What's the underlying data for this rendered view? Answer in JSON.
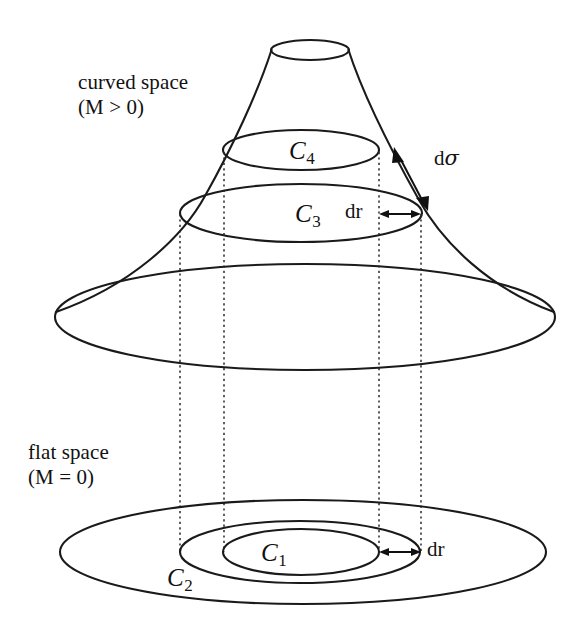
{
  "figure": {
    "background_color": "#ffffff",
    "ink_color": "#111111",
    "width": 571,
    "height": 631
  },
  "labels": {
    "curved_space": {
      "line1": "curved space",
      "line2": "(M > 0)"
    },
    "flat_space": {
      "line1": "flat space",
      "line2": "(M = 0)"
    },
    "circles": {
      "c1": {
        "base": "C",
        "sub": "1"
      },
      "c2": {
        "base": "C",
        "sub": "2"
      },
      "c3": {
        "base": "C",
        "sub": "3"
      },
      "c4": {
        "base": "C",
        "sub": "4"
      }
    },
    "measures": {
      "dr_curved": "dr",
      "dr_flat": "dr",
      "dsigma_prefix": "d",
      "dsigma_symbol": "σ"
    }
  },
  "geometry": {
    "curved_surface": {
      "throat_ellipse": {
        "cx": 310,
        "cy": 50,
        "rx": 39,
        "ry": 10
      },
      "c4_ellipse": {
        "cx": 301,
        "cy": 150,
        "rx": 78,
        "ry": 20
      },
      "c3_ellipse": {
        "cx": 301,
        "cy": 213,
        "rx": 121,
        "ry": 29
      },
      "base_ellipse": {
        "cx": 305,
        "cy": 317,
        "rx": 250,
        "ry": 53
      }
    },
    "flat_surface": {
      "outer_ellipse": {
        "cx": 303,
        "cy": 552,
        "rx": 243,
        "ry": 52
      },
      "c2_ellipse": {
        "cx": 300,
        "cy": 552,
        "rx": 120,
        "ry": 31
      },
      "c1_ellipse": {
        "cx": 301,
        "cy": 552,
        "rx": 78,
        "ry": 23
      }
    },
    "projection_lines_x": [
      180,
      224,
      379,
      421
    ],
    "dsigma_arrow": {
      "x1": 396,
      "y1": 152,
      "x2": 426,
      "y2": 206
    },
    "dr_curved_arrow": {
      "x1": 380,
      "y1": 214,
      "x2": 420,
      "y2": 214
    },
    "dr_flat_arrow": {
      "x1": 380,
      "y1": 552,
      "x2": 420,
      "y2": 552
    }
  }
}
